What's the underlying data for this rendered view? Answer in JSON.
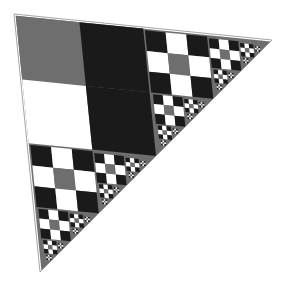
{
  "image": {
    "title": "Recursive checkerboard right-triangle fractal",
    "width": 286,
    "height": 287,
    "background_color": "#ffffff"
  },
  "palette": {
    "background": "#ffffff",
    "gray": "#6e6e6e",
    "black": "#1a1a1a",
    "white": "#ffffff",
    "seam": "#ffffff",
    "edge_outline": "#9a9a9a"
  },
  "geometry": {
    "description": "Right isoceles triangle with the right angle at the top-left corner, legs running right and down.",
    "apex_top_left": [
      14,
      14
    ],
    "apex_right": [
      272,
      40
    ],
    "apex_bottom": [
      40,
      272
    ],
    "leg_length": 258,
    "rotation_deg": 6,
    "seam_width": 3.2
  },
  "fractal": {
    "type": "recursive-right-triangle-subdivision",
    "max_depth": 4,
    "branch_count": 2,
    "subdivision_rule": "Each right triangle splits along its hypotenuse midpoint into two half-scale right triangles plus a central checkerboard square band.",
    "scale_factor": 0.5,
    "tile_grid": 3,
    "tile_pattern": [
      [
        "black",
        "white",
        "black"
      ],
      [
        "white",
        "gray",
        "white"
      ],
      [
        "black",
        "white",
        "black"
      ]
    ],
    "center_block_colors": [
      "gray",
      "black",
      "white",
      "black"
    ],
    "depth_colors": {
      "0": "gray",
      "1": "gray",
      "2": "gray",
      "3": "gray"
    }
  },
  "chart_data": {
    "type": "heatmap",
    "categories": [
      "col-1",
      "col-2",
      "col-3"
    ],
    "rows": [
      "row-1",
      "row-2",
      "row-3"
    ],
    "values": [
      [
        1,
        0,
        1
      ],
      [
        0,
        2,
        0
      ],
      [
        1,
        0,
        1
      ]
    ],
    "legend": [
      {
        "label": "black",
        "value": 1,
        "color": "#1a1a1a"
      },
      {
        "label": "white",
        "value": 0,
        "color": "#ffffff"
      },
      {
        "label": "gray",
        "value": 2,
        "color": "#6e6e6e"
      }
    ],
    "xlabel": "",
    "ylabel": "",
    "grid": false,
    "legend_position": "none",
    "annotations": [
      "4 levels of self-similar right triangles",
      "Largest checkerboard band sits along the main hypotenuse",
      "Each sub-triangle repeats the 3x3 checkerboard motif at half scale"
    ]
  }
}
